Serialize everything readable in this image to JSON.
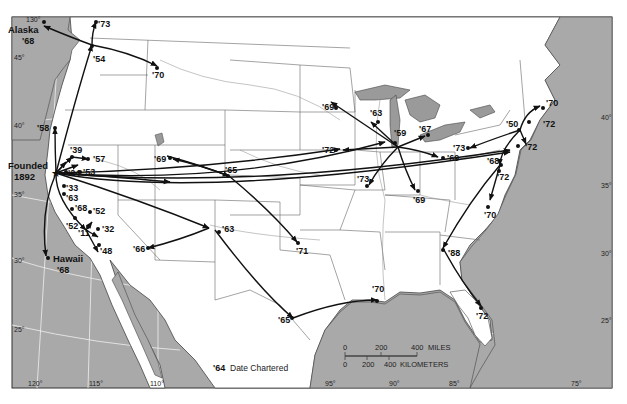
{
  "map": {
    "colors": {
      "ocean": "#a9a9a9",
      "land": "#ffffff",
      "lakes": "#9a9a9a",
      "borders": "#555555",
      "graticule": "#f2f2f2",
      "routes": "#111111"
    },
    "founded": {
      "label_line1": "Founded",
      "label_line2": "1892"
    },
    "legend": {
      "sample_year": "'64",
      "text": "Date Chartered"
    },
    "scale": {
      "miles_ticks": [
        "0",
        "200",
        "400"
      ],
      "miles_unit": "MILES",
      "km_ticks": [
        "0",
        "200",
        "400"
      ],
      "km_unit": "KILOMETERS"
    },
    "longitude_labels": [
      "130°",
      "120°",
      "115°",
      "110°",
      "95°",
      "90°",
      "85°",
      "75°"
    ],
    "latitude_labels": [
      "45°",
      "40°",
      "35°",
      "30°",
      "25°",
      "40°",
      "35°",
      "30°",
      "25°"
    ],
    "chapters": [
      {
        "name": "Alaska",
        "year": "'68"
      },
      {
        "name": "Hawaii",
        "year": "'68"
      },
      {
        "name": "",
        "year": "'73"
      },
      {
        "name": "",
        "year": "'54"
      },
      {
        "name": "",
        "year": "'70"
      },
      {
        "name": "",
        "year": "'58"
      },
      {
        "name": "",
        "year": "'39"
      },
      {
        "name": "",
        "year": "'57"
      },
      {
        "name": "",
        "year": "'24"
      },
      {
        "name": "",
        "year": "'53"
      },
      {
        "name": "",
        "year": "'33"
      },
      {
        "name": "",
        "year": "'63"
      },
      {
        "name": "",
        "year": "'68"
      },
      {
        "name": "",
        "year": "'52"
      },
      {
        "name": "",
        "year": "'52"
      },
      {
        "name": "",
        "year": "'11"
      },
      {
        "name": "",
        "year": "'32"
      },
      {
        "name": "",
        "year": "'48"
      },
      {
        "name": "",
        "year": "'69"
      },
      {
        "name": "",
        "year": "'65"
      },
      {
        "name": "",
        "year": "'71"
      },
      {
        "name": "",
        "year": "'63"
      },
      {
        "name": "",
        "year": "'66"
      },
      {
        "name": "",
        "year": "'65"
      },
      {
        "name": "",
        "year": "'70"
      },
      {
        "name": "",
        "year": "'59"
      },
      {
        "name": "",
        "year": "'69"
      },
      {
        "name": "",
        "year": "'63"
      },
      {
        "name": "",
        "year": "'67"
      },
      {
        "name": "",
        "year": "'72"
      },
      {
        "name": "",
        "year": "'69"
      },
      {
        "name": "",
        "year": "'73"
      },
      {
        "name": "",
        "year": "'69"
      },
      {
        "name": "",
        "year": "'73"
      },
      {
        "name": "",
        "year": "'50"
      },
      {
        "name": "",
        "year": "'70"
      },
      {
        "name": "",
        "year": "'72"
      },
      {
        "name": "",
        "year": "'72"
      },
      {
        "name": "",
        "year": "'68"
      },
      {
        "name": "",
        "year": "'72"
      },
      {
        "name": "",
        "year": "'70"
      },
      {
        "name": "",
        "year": "'88"
      },
      {
        "name": "",
        "year": "'72"
      }
    ]
  }
}
